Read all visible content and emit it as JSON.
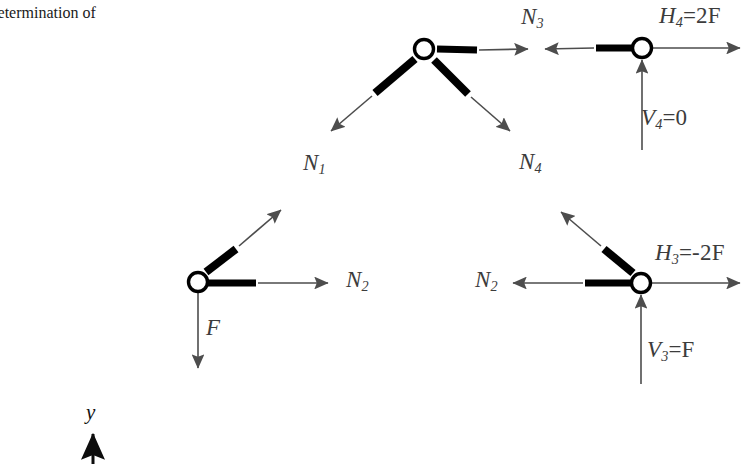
{
  "caption": {
    "line1": "Determination of",
    "line2": "es"
  },
  "diagram": {
    "colors": {
      "member": "#000000",
      "arrow": "#4d4d4d",
      "node_stroke": "#000000",
      "node_fill": "#ffffff",
      "axis": "#000000",
      "text": "#3c3c3c"
    },
    "nodes": [
      {
        "name": "apex-node",
        "x": 424,
        "y": 49
      },
      {
        "name": "top-right-node",
        "x": 642,
        "y": 48
      },
      {
        "name": "bottom-left-node",
        "x": 198,
        "y": 282
      },
      {
        "name": "bottom-right-node",
        "x": 641,
        "y": 283
      }
    ],
    "labels": {
      "n1": "N",
      "n1_sub": "1",
      "n2_left": "N",
      "n2_left_sub": "2",
      "n2_right": "N",
      "n2_right_sub": "2",
      "n3": "N",
      "n3_sub": "3",
      "n4": "N",
      "n4_sub": "4",
      "force_f": "F",
      "h4": "H",
      "h4_sub": "4",
      "h4_val": "=2F",
      "v4": "V",
      "v4_sub": "4",
      "v4_val": "=0",
      "h3": "H",
      "h3_sub": "3",
      "h3_val": "=-2F",
      "v3": "V",
      "v3_sub": "3",
      "v3_val": "=F",
      "axis_y": "y"
    }
  }
}
